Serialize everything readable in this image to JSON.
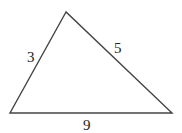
{
  "diagram": {
    "type": "triangle",
    "stroke_color": "#444444",
    "vertices": {
      "top": {
        "x": 66,
        "y": 12
      },
      "bottom_left": {
        "x": 10,
        "y": 113
      },
      "bottom_right": {
        "x": 172,
        "y": 113
      }
    },
    "sides": [
      {
        "name": "left",
        "label": "3",
        "label_x": 27,
        "label_y": 62
      },
      {
        "name": "right",
        "label": "5",
        "label_x": 114,
        "label_y": 53
      },
      {
        "name": "base",
        "label": "9",
        "label_x": 83,
        "label_y": 130
      }
    ]
  }
}
